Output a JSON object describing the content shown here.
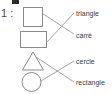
{
  "exercise": {
    "number": "1 :"
  },
  "shapes": [
    {
      "name": "square",
      "icon": "square-shape"
    },
    {
      "name": "rectangle",
      "icon": "rectangle-shape"
    },
    {
      "name": "triangle",
      "icon": "triangle-shape"
    },
    {
      "name": "circle",
      "icon": "circle-shape"
    }
  ],
  "labels": [
    {
      "id": "triangle",
      "text": "triangle"
    },
    {
      "id": "carre",
      "text": "carré"
    },
    {
      "id": "cercle",
      "text": "cercle"
    },
    {
      "id": "rectangle",
      "text": "rectangle"
    }
  ],
  "matches": [
    {
      "from": "square",
      "to": "carre"
    },
    {
      "from": "rectangle",
      "to": "triangle"
    },
    {
      "from": "triangle",
      "to": "rectangle"
    },
    {
      "from": "circle",
      "to": "cercle"
    }
  ],
  "colors": {
    "shape_stroke": "#8a8a8a",
    "line_stroke": "#9a9a9a",
    "text": "#3d3d3d",
    "mark": "#2b2b2b",
    "background": "#ffffff"
  }
}
